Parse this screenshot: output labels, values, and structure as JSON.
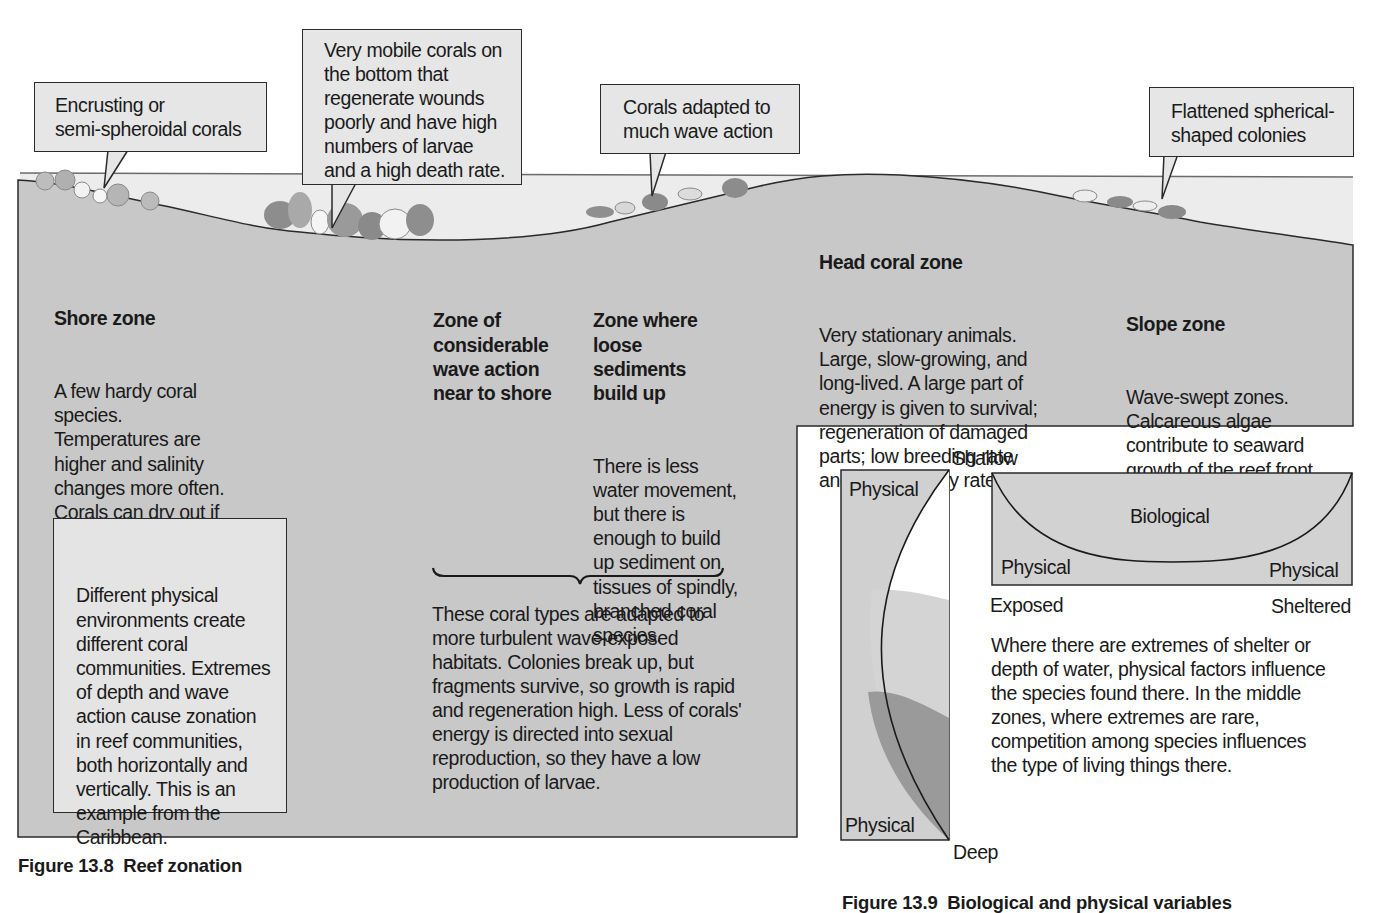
{
  "figure_13_8": {
    "caption": "Figure 13.8  Reef zonation",
    "callouts": [
      {
        "id": "encrusting",
        "lines": [
          "Encrusting or",
          "semi-spheroidal corals"
        ]
      },
      {
        "id": "mobile",
        "lines": [
          "Very mobile corals on",
          "the bottom that",
          "regenerate wounds",
          "poorly and have high",
          "numbers of larvae",
          "and a high death rate."
        ]
      },
      {
        "id": "wave-adapted",
        "lines": [
          "Corals adapted to",
          "much wave action"
        ]
      },
      {
        "id": "flattened",
        "lines": [
          "Flattened spherical-",
          "shaped colonies"
        ]
      }
    ],
    "zones": {
      "shore": {
        "title": "Shore zone",
        "body": "A few hardy coral\nspecies.\nTemperatures are\nhigher and salinity\nchanges more often.\nCorals can dry out if\nexposed at low tide."
      },
      "wave_action": {
        "title": "Zone of\nconsiderable\nwave action\nnear to shore"
      },
      "sediments": {
        "title": "Zone where\nloose\nsediments\nbuild up",
        "body": "There is less\nwater movement,\nbut there is\nenough to build\nup sediment on\ntissues of spindly,\nbranched coral\nspecies."
      },
      "head_coral": {
        "title": "Head coral zone",
        "body": "Very stationary animals.\nLarge, slow-growing, and\nlong-lived. A large part of\nenergy is given to survival;\nregeneration of damaged\nparts; low breeding rate\nand low mortality rate."
      },
      "slope": {
        "title": "Slope zone",
        "body": "Wave-swept zones.\nCalcareous algae\ncontribute to seaward\ngrowth of the reef front."
      }
    },
    "brace_note": "These coral types are adapted to\nmore turbulent wave-exposed\nhabitats. Colonies break up, but\nfragments survive, so growth is rapid\nand regeneration high. Less of corals'\nenergy is directed into sexual\nreproduction, so they have a low\nproduction of larvae.",
    "summary_box": "Different physical\nenvironments create\ndifferent coral\ncommunities. Extremes\nof depth and wave\naction cause zonation\nin reef communities,\nboth horizontally and\nvertically. This is an\nexample from the\nCaribbean."
  },
  "figure_13_9": {
    "caption": "Figure 13.9  Biological and physical variables",
    "depth_diagram": {
      "top_label": "Shallow",
      "bottom_label": "Deep",
      "upper_region": "Physical",
      "lower_region": "Physical"
    },
    "shelter_diagram": {
      "center_region": "Biological",
      "left_region": "Physical",
      "right_region": "Physical",
      "left_axis": "Exposed",
      "right_axis": "Sheltered"
    },
    "explanation": "Where there are extremes of shelter or\ndepth of water, physical factors influence\nthe species found there. In the middle\nzones, where extremes are rare,\ncompetition among species influences\nthe type of living things there."
  },
  "colors": {
    "reef_fill": "#c6c6c6",
    "water_fill": "#e9e9e9",
    "box_fill": "#e4e4e4",
    "coral_dark": "#8a8a8a",
    "coral_light": "#f2f2f2",
    "outline": "#2a2a2a"
  }
}
